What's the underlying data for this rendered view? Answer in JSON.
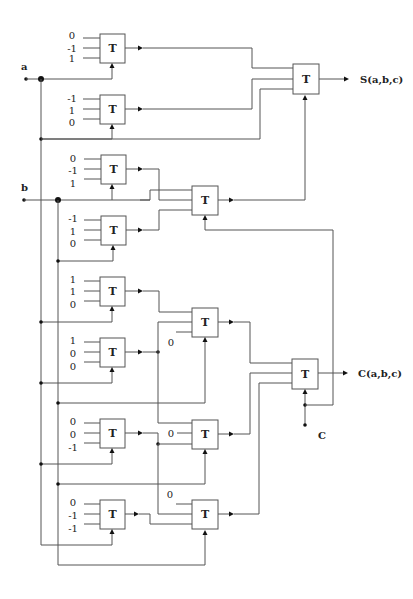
{
  "diagram": {
    "gate_symbol": "T",
    "inputs": {
      "a": "a",
      "b": "b",
      "c": "C"
    },
    "outputs": {
      "sum": "S(a,b,c)",
      "carry": "C(a,b,c)"
    },
    "constant_zero": "0",
    "first_stage_gates": [
      {
        "id": "G1",
        "consts": [
          "0",
          "-1",
          "1"
        ],
        "control": "a"
      },
      {
        "id": "G2",
        "consts": [
          "-1",
          "1",
          "0"
        ],
        "control": "a"
      },
      {
        "id": "G3",
        "consts": [
          "0",
          "-1",
          "1"
        ],
        "control": "b"
      },
      {
        "id": "G4",
        "consts": [
          "-1",
          "1",
          "0"
        ],
        "control": "b"
      },
      {
        "id": "G5",
        "consts": [
          "1",
          "1",
          "0"
        ],
        "control": "a"
      },
      {
        "id": "G6",
        "consts": [
          "1",
          "0",
          "0"
        ],
        "control": "a"
      },
      {
        "id": "G7",
        "consts": [
          "0",
          "0",
          "-1"
        ],
        "control": "a"
      },
      {
        "id": "G8",
        "consts": [
          "0",
          "-1",
          "-1"
        ],
        "control": "a"
      }
    ],
    "second_stage_gates": [
      {
        "id": "M1",
        "control": "b"
      },
      {
        "id": "M2",
        "control": "b",
        "const": "0"
      },
      {
        "id": "M3",
        "control": "b",
        "const": "0"
      },
      {
        "id": "M4",
        "control": "b",
        "const": "0"
      }
    ],
    "final_gates": [
      {
        "id": "FS",
        "control": "c",
        "output": "S(a,b,c)"
      },
      {
        "id": "FC",
        "control": "c",
        "output": "C(a,b,c)"
      }
    ]
  }
}
